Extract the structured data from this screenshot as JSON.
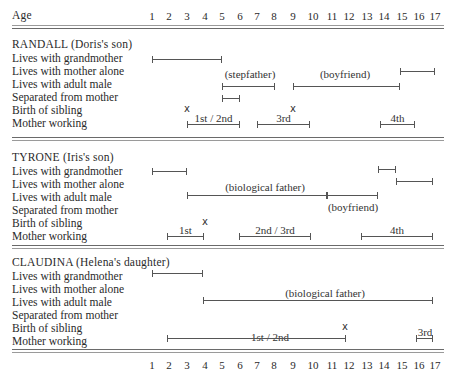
{
  "header": {
    "age_label": "Age"
  },
  "axis": {
    "ticks": [
      "1",
      "2",
      "3",
      "4",
      "5",
      "6",
      "7",
      "8",
      "9",
      "10",
      "11",
      "12",
      "13",
      "14",
      "15",
      "16",
      "17"
    ]
  },
  "row_labels": [
    "Lives with grandmother",
    "Lives with mother alone",
    "Lives with adult male",
    "Separated from mother",
    "Birth of sibling",
    "Mother working"
  ],
  "children": [
    {
      "title": "RANDALL (Doris's son)",
      "bars": [
        {
          "row": "Lives with grandmother",
          "from": 1,
          "to": 5
        },
        {
          "row": "Lives with mother alone",
          "from": 15,
          "to": 17
        },
        {
          "row": "Lives with adult male",
          "from": 5,
          "to": 8,
          "label": "(stepfather)"
        },
        {
          "row": "Lives with adult male",
          "from": 9,
          "to": 15,
          "label": "(boyfriend)"
        },
        {
          "row": "Separated from mother",
          "from": 5,
          "to": 6
        },
        {
          "row": "Mother working",
          "from": 3,
          "to": 6,
          "label": "1st/2nd"
        },
        {
          "row": "Mother working",
          "from": 7,
          "to": 10,
          "label": "3rd"
        },
        {
          "row": "Mother working",
          "from": 14,
          "to": 16,
          "label": "4th"
        }
      ],
      "sibling_births": [
        3,
        9
      ]
    },
    {
      "title": "TYRONE (Iris's son)",
      "bars": [
        {
          "row": "Lives with grandmother",
          "from": 1,
          "to": 3
        },
        {
          "row": "Lives with grandmother",
          "from": 14,
          "to": 15
        },
        {
          "row": "Lives with mother alone",
          "from": 15,
          "to": 17
        },
        {
          "row": "Lives with adult male",
          "from": 3,
          "to": 11,
          "label": "(biological father)"
        },
        {
          "row": "Lives with adult male",
          "from": 11,
          "to": 14,
          "label": "(boyfriend)"
        },
        {
          "row": "Mother working",
          "from": 2,
          "to": 4,
          "label": "1st"
        },
        {
          "row": "Mother working",
          "from": 6,
          "to": 10,
          "label": "2nd/3rd"
        },
        {
          "row": "Mother working",
          "from": 13,
          "to": 17,
          "label": "4th"
        }
      ],
      "sibling_births": [
        4
      ]
    },
    {
      "title": "CLAUDINA (Helena's daughter)",
      "bars": [
        {
          "row": "Lives with grandmother",
          "from": 1,
          "to": 4
        },
        {
          "row": "Lives with adult male",
          "from": 4,
          "to": 17,
          "label": "(biological father)"
        },
        {
          "row": "Mother working",
          "from": 2,
          "to": 12,
          "label": "1st/2nd"
        },
        {
          "row": "Mother working",
          "from": 16,
          "to": 17,
          "label": "3rd"
        }
      ],
      "sibling_births": [
        12
      ]
    }
  ],
  "text": {
    "randall_title": "RANDALL (Doris's son)",
    "tyrone_title": "TYRONE (Iris's son)",
    "claudina_title": "CLAUDINA (Helena's daughter)",
    "row1": "Lives with grandmother",
    "row2": "Lives with mother alone",
    "row3": "Lives with adult male",
    "row4": "Separated from mother",
    "row5": "Birth of sibling",
    "row6": "Mother working",
    "stepfather": "(stepfather)",
    "boyfriend": "(boyfriend)",
    "biological_father": "(biological father)",
    "first_second": "1st / 2nd",
    "first": "1st",
    "second_third": "2nd / 3rd",
    "third": "3rd",
    "fourth": "4th",
    "birth_mark": "x"
  }
}
